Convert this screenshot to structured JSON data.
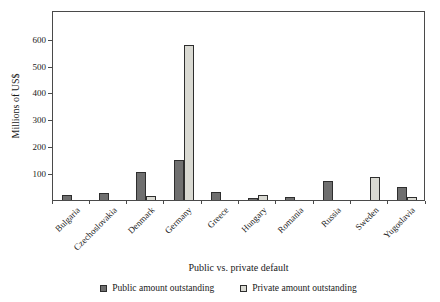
{
  "chart_data": {
    "type": "bar",
    "title": "",
    "xlabel": "Public vs. private default",
    "ylabel": "Millions of US$",
    "ylim": [
      0,
      710
    ],
    "y_ticks": [
      100,
      200,
      300,
      400,
      500,
      600
    ],
    "grid": false,
    "legend_position": "bottom",
    "categories": [
      "Bulgaria",
      "Czechoslovakia",
      "Denmark",
      "Germany",
      "Greece",
      "Hungary",
      "Romania",
      "Russia",
      "Sweden",
      "Yugoslavia"
    ],
    "series": [
      {
        "name": "Public amount outstanding",
        "color": "#6f6f6f",
        "values": [
          20,
          25,
          105,
          150,
          30,
          8,
          12,
          70,
          0,
          50
        ]
      },
      {
        "name": "Private amount outstanding",
        "color": "#d9d9d2",
        "values": [
          0,
          0,
          15,
          580,
          0,
          20,
          0,
          0,
          85,
          10
        ]
      }
    ],
    "colors": {
      "axis_line": "#4a4a4a",
      "bar_border": "#2e2e2e",
      "text": "#1a1a1a",
      "background": "#ffffff"
    }
  }
}
